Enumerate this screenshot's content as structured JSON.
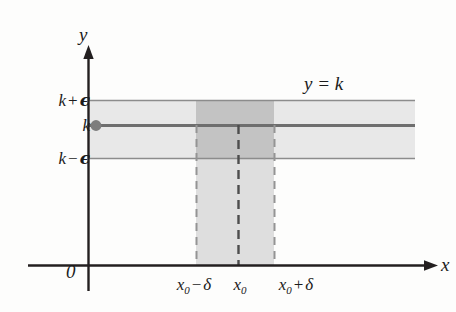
{
  "figure": {
    "axes": {
      "y_axis_label": "y",
      "x_axis_label": "x",
      "origin_label": "0"
    },
    "curve_label": "y = k",
    "y_ticks": [
      {
        "id": "k-plus-epsilon",
        "base": "k",
        "op": "+",
        "sym": "ϵ",
        "value_px": 100
      },
      {
        "id": "k",
        "base": "k",
        "op": "",
        "sym": "",
        "value_px": 125
      },
      {
        "id": "k-minus-epsilon",
        "base": "k",
        "op": "−",
        "sym": "ϵ",
        "value_px": 158
      }
    ],
    "x_ticks": [
      {
        "id": "x0-minus-delta",
        "base": "x",
        "sub": "0",
        "op": "−",
        "sym": "δ",
        "value_px": 196
      },
      {
        "id": "x0",
        "base": "x",
        "sub": "0",
        "op": "",
        "sym": "",
        "value_px": 238
      },
      {
        "id": "x0-plus-delta",
        "base": "x",
        "sub": "0",
        "op": "+",
        "sym": "δ",
        "value_px": 274
      }
    ],
    "colors": {
      "axis": "#231f20",
      "band_fill": "#e6e6e6",
      "band_edge": "#8a8a8a",
      "overlap_fill": "#c2c2c2",
      "strip_fill": "#dcdcdc",
      "k_line": "#6e6e6e",
      "dashed": "#8f8f8f",
      "dashed_center": "#4a4a4a",
      "dot": "#7a7a7a",
      "text": "#1b1b1b"
    },
    "geometry": {
      "y_axis_x": 88,
      "x_axis_y": 265,
      "band_left": 88,
      "band_right": 415,
      "band_top": 100,
      "band_bottom": 158,
      "k_line_y": 125,
      "strip_left": 196,
      "strip_right": 274,
      "strip_top": 100,
      "strip_bottom": 265,
      "center_x": 238,
      "dot_x": 97,
      "dot_y": 125,
      "dot_r": 5
    }
  }
}
